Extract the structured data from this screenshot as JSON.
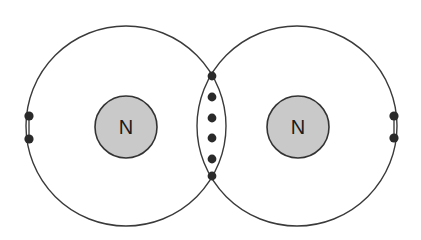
{
  "colors": {
    "shell": "#3a3a3a",
    "nucleus_fill": "#c9c9c9",
    "electron": "#2a2a2a",
    "background": "#ffffff"
  },
  "atoms": [
    {
      "symbol": "N",
      "center": [
        126,
        126
      ],
      "shell_radius": 100,
      "nucleus_radius": 31,
      "lone_pair": {
        "x": 29,
        "y": [
          116,
          139
        ]
      }
    },
    {
      "symbol": "N",
      "center": [
        297,
        126
      ],
      "shell_radius": 100,
      "nucleus_radius": 31,
      "lone_pair": {
        "x": 394,
        "y": [
          116,
          138
        ]
      }
    }
  ],
  "shared_electrons": {
    "x": 212,
    "y": [
      76,
      97,
      118,
      138,
      159,
      176
    ],
    "count": 6,
    "bond_type": "triple"
  }
}
